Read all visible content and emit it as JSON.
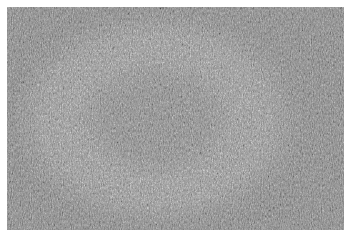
{
  "image": {
    "description": "Grayscale micrograph of a dense fibrous texture with a lighter circular ring region",
    "colors": {
      "background_margin": "#ffffff",
      "base_gray": "#8a8a8a",
      "ring_light": "#b4b4b4",
      "center_gray": "#8e8e8e",
      "speck_dark": "#3c3c3c"
    },
    "ring": {
      "center_x_pct": 47,
      "center_y_pct": 50,
      "outer_radius_pct": 44,
      "inner_radius_pct": 20
    }
  }
}
